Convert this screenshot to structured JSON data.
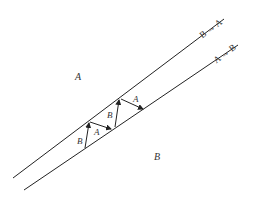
{
  "diagram": {
    "type": "phase-boundary-migration",
    "regions": [
      {
        "label": "A",
        "x": 78,
        "y": 80
      },
      {
        "label": "B",
        "x": 157,
        "y": 160
      }
    ],
    "boundaries": [
      {
        "name": "upper-boundary",
        "label": "B → A",
        "x1": 13,
        "y1": 178,
        "x2": 224,
        "y2": 19
      },
      {
        "name": "lower-boundary",
        "label": "A → B",
        "x1": 24,
        "y1": 190,
        "x2": 238,
        "y2": 45
      }
    ],
    "arrows": [
      {
        "label": "B",
        "x1": 85,
        "y1": 148,
        "x2": 89,
        "y2": 122
      },
      {
        "label": "A",
        "x1": 90,
        "y1": 122,
        "x2": 111,
        "y2": 129
      },
      {
        "label": "B",
        "x1": 115,
        "y1": 127,
        "x2": 119,
        "y2": 99
      },
      {
        "label": "A",
        "x1": 121,
        "y1": 99,
        "x2": 143,
        "y2": 109
      }
    ],
    "arrow_labels": [
      {
        "text": "B",
        "x": 80,
        "y": 143
      },
      {
        "text": "A",
        "x": 97,
        "y": 135
      },
      {
        "text": "B",
        "x": 111,
        "y": 117
      },
      {
        "text": "A",
        "x": 136,
        "y": 102
      }
    ],
    "colors": {
      "line": "#222222",
      "text": "#333333",
      "background": "#ffffff"
    }
  }
}
